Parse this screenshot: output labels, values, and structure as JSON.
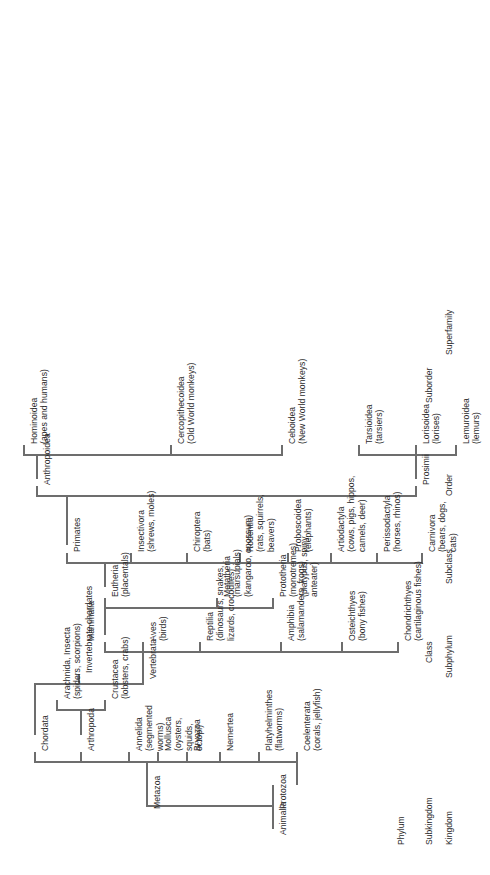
{
  "diagram": {
    "type": "taxonomy-tree",
    "orientation": "rotated-90-ccw",
    "line_color": "#6d6d6d",
    "text_color": "#2b2b2b",
    "background": "#ffffff"
  },
  "rank_labels": [
    "Kingdom",
    "Subkingdom",
    "Phylum",
    "Subphylum",
    "Class",
    "Subclass",
    "Order",
    "Suborder",
    "Superfamily"
  ],
  "nodes": {
    "kingdom": {
      "animalia": "Animalia"
    },
    "subkingdom": {
      "protozoa": "Protozoa",
      "metazoa": "Metazoa"
    },
    "phylum": {
      "coelenterata": "Coelenterata\n(corals, jellyfish)",
      "platyhelminthes": "Platyhelminthes\n(flatworms)",
      "nemertea": "Nemertea",
      "bryozoa": "Bryozoa",
      "mollusca": "Mollusca\n(oysters,\nsquids,\noctopi)",
      "annelida": "Annelida\n(segmented\nworms)",
      "arthropoda": "Arthropoda",
      "chordata": "Chordata"
    },
    "arthropod_classes": {
      "crustacea": "Crustacea\n(lobsters, crabs)",
      "arachnida_insecta": "Arachnida, Insecta\n(spiders, scorpions)"
    },
    "subphylum": {
      "invertebrate_chordates": "Invertebrate chordates",
      "vertebrata": "Vertebrata"
    },
    "class": {
      "chondrichthyes": "Chondrichthyes\n(cartilaginous fishes)",
      "osteichthyes": "Osteichthyes\n(bony fishes)",
      "amphibia": "Amphibia\n(salamanders, frogs)",
      "reptilia": "Reptilia\n(dinosaurs, snakes,\nlizards, crocodiles)",
      "aves": "Aves\n(birds)",
      "mammalia": "Mammalia"
    },
    "subclass": {
      "prototheria": "Prototheria\n(monotremes)\n(platypus, spiny\nanteater)",
      "metatheria": "Metatheria\n(marsupials)\n(kangaroo, opossum)",
      "eutheria": "Eutheria\n(placentals)"
    },
    "order": {
      "carnivora": "Carnivora\n(bears, dogs,\ncats)",
      "perissodactyla": "Perissodactyla\n(horses, rhinos)",
      "artiodactyla": "Artiodactyla\n(cows, pigs, hippos,\ncamels, deer)",
      "proboscoidea": "Proboscoidea\n(elephants)",
      "rodentia": "Rodentia\n(rats, squirrels,\nbeavers)",
      "chiroptera": "Chiroptera\n(bats)",
      "insectivora": "Insectivora\n(shrews, moles)",
      "primates": "Primates"
    },
    "suborder": {
      "prosimii": "Prosimii",
      "anthropoidea": "Anthropoidea"
    },
    "superfamily": {
      "lemuroidea": "Lemuroidea\n(lemurs)",
      "lorisoidea": "Lorisoidea\n(lorises)",
      "tarsioidea": "Tarsioidea\n(tarsiers)",
      "ceboidea": "Ceboidea\n(New World monkeys)",
      "cercopithecoidea": "Cercopithecoidea\n(Old World monkeys)",
      "hominoidea": "Hominoidea\n(apes and humans)"
    }
  }
}
